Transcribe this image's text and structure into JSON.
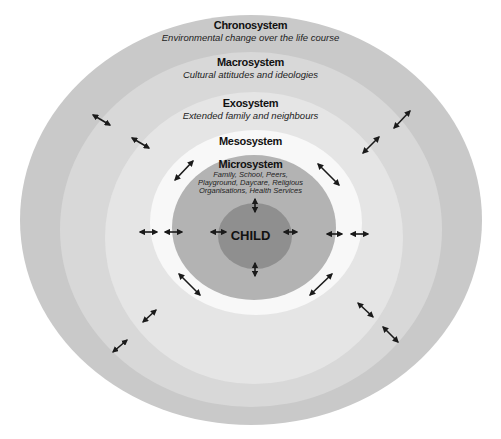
{
  "diagram": {
    "type": "nested-ellipses",
    "layers": [
      {
        "name": "Chronosystem",
        "description": "Environmental change over the life course",
        "color": "#c9c9c9"
      },
      {
        "name": "Macrosystem",
        "description": "Cultural attitudes and ideologies",
        "color": "#d9d9d9"
      },
      {
        "name": "Exosystem",
        "description": "Extended family and neighbours",
        "color": "#e6e6e6"
      },
      {
        "name": "Mesosystem",
        "description": "",
        "color": "#f7f7f7"
      },
      {
        "name": "Microsystem",
        "description_lines": [
          "Family, School, Peers,",
          "Playground, Daycare, Religious",
          "Organisations, Health Services"
        ],
        "color": "#b3b3b3"
      },
      {
        "name": "CHILD",
        "color": "#8f8f8f"
      }
    ],
    "arrow_color": "#1a1a1a"
  }
}
